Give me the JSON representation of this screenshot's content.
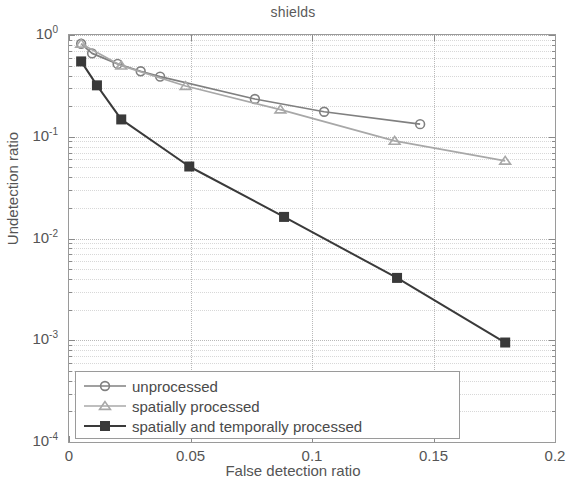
{
  "chart_data": {
    "type": "line",
    "title": "shields",
    "xlabel": "False detection ratio",
    "ylabel": "Undetection ratio",
    "xlim": [
      0,
      0.2
    ],
    "ylim": [
      0.0001,
      1
    ],
    "yscale": "log",
    "xscale": "linear",
    "grid": true,
    "legend_position": "lower left",
    "xticks": [
      0,
      0.05,
      0.1,
      0.15,
      0.2
    ],
    "xticklabels": [
      "0",
      "0.05",
      "0.1",
      "0.15",
      "0.2"
    ],
    "yticks": [
      0.0001,
      0.001,
      0.01,
      0.1,
      1
    ],
    "yticklabels": [
      "10-4",
      "10-3",
      "10-2",
      "10-1",
      "100"
    ],
    "ytick_mantissa": "10",
    "ytick_exponents": [
      "-4",
      "-3",
      "-2",
      "-1",
      "0"
    ],
    "series": [
      {
        "name": "unprocessed",
        "marker": "circle",
        "color": "#808080",
        "x": [
          0.005,
          0.0095,
          0.02,
          0.0295,
          0.0375,
          0.0765,
          0.105,
          0.1445
        ],
        "y": [
          0.82,
          0.66,
          0.52,
          0.44,
          0.39,
          0.235,
          0.176,
          0.133
        ]
      },
      {
        "name": "spatially processed",
        "marker": "triangle",
        "color": "#a8a8a8",
        "x": [
          0.005,
          0.0215,
          0.048,
          0.087,
          0.134,
          0.1795
        ],
        "y": [
          0.82,
          0.5,
          0.315,
          0.185,
          0.091,
          0.058
        ]
      },
      {
        "name": "spatially and temporally processed",
        "marker": "square",
        "color": "#3a3a3a",
        "x": [
          0.005,
          0.0115,
          0.0215,
          0.0495,
          0.0885,
          0.135,
          0.1795
        ],
        "y": [
          0.55,
          0.32,
          0.148,
          0.051,
          0.0163,
          0.0041,
          0.00095
        ]
      }
    ]
  },
  "legend": {
    "items": [
      {
        "label": "unprocessed"
      },
      {
        "label": "spatially processed"
      },
      {
        "label": "spatially and temporally processed"
      }
    ]
  }
}
